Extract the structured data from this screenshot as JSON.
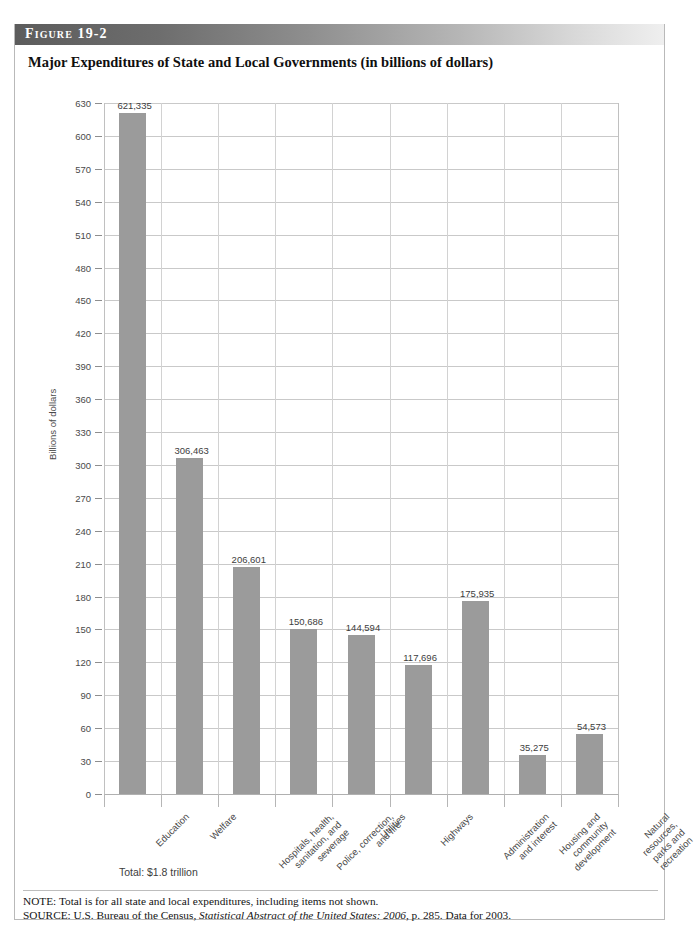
{
  "figure": {
    "header_label": "Figure 19-2",
    "title": "Major Expenditures of State and Local Governments (in billions of dollars)",
    "total_note": "Total: $1.8 trillion",
    "note_line": "NOTE: Total is for all state and local expenditures, including items not shown.",
    "source_prefix": "SOURCE: U.S. Bureau of the Census, ",
    "source_italic": "Statistical Abstract of the United States: 2006",
    "source_suffix": ", p. 285. Data for 2003."
  },
  "colors": {
    "bar": "#9b9b9b",
    "gridline": "#c9c9c9",
    "header_dark": "#5c5c5c",
    "header_light": "#efefef",
    "text": "#3d3d3d"
  },
  "chart_data": {
    "type": "bar",
    "title": "Major Expenditures of State and Local Governments (in billions of dollars)",
    "xlabel": "",
    "ylabel": "Billions of dollars",
    "ylim": [
      0,
      630
    ],
    "ytick_step": 30,
    "yticks": [
      0,
      30,
      60,
      90,
      120,
      150,
      180,
      210,
      240,
      270,
      300,
      330,
      360,
      390,
      420,
      450,
      480,
      510,
      540,
      570,
      600,
      630
    ],
    "ytick_labels": [
      "0",
      "30",
      "60",
      "90",
      "120",
      "150",
      "180",
      "210",
      "240",
      "270",
      "300",
      "330",
      "360",
      "390",
      "420",
      "450",
      "480",
      "510",
      "540",
      "570",
      "600",
      "630"
    ],
    "grid": true,
    "legend": "none",
    "categories": [
      "Education",
      "Welfare",
      "Hospitals, health,\nsanitation, and\nsewerage",
      "Police, correction,\nand fire",
      "Utilities",
      "Highways",
      "Administration\nand interest",
      "Housing and\ncommunity\ndevelopment",
      "Natural resources,\nparks and recreation"
    ],
    "values": [
      621.335,
      306.463,
      206.601,
      150.686,
      144.594,
      117.696,
      175.935,
      35.275,
      54.573
    ],
    "value_labels": [
      "621,335",
      "306,463",
      "206,601",
      "150,686",
      "144,594",
      "117,696",
      "175,935",
      "35,275",
      "54,573"
    ],
    "units_note": "values shown in millions of dollars; axis in billions"
  }
}
